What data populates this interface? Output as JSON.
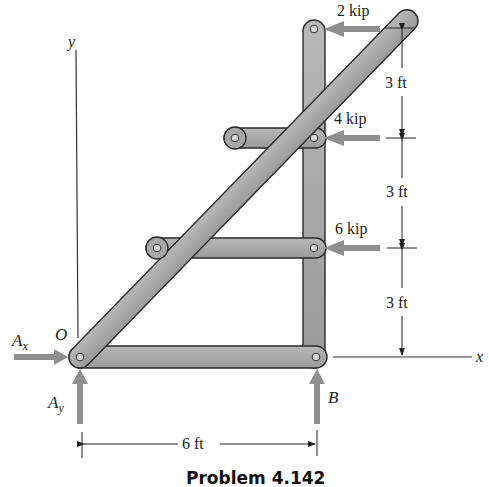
{
  "figure": {
    "caption": "Problem 4.142",
    "axes": {
      "x_label": "x",
      "y_label": "y",
      "origin_label": "O"
    },
    "loads": [
      {
        "label": "2 kip",
        "magnitude": 2,
        "unit": "kip",
        "direction": "left"
      },
      {
        "label": "4 kip",
        "magnitude": 4,
        "unit": "kip",
        "direction": "left"
      },
      {
        "label": "6 kip",
        "magnitude": 6,
        "unit": "kip",
        "direction": "left"
      }
    ],
    "reactions": {
      "ax": {
        "label_main": "A",
        "label_sub": "x",
        "direction": "right"
      },
      "ay": {
        "label_main": "A",
        "label_sub": "y",
        "direction": "up"
      },
      "b": {
        "label": "B",
        "direction": "up"
      }
    },
    "dimensions": {
      "vertical": [
        "3 ft",
        "3 ft",
        "3 ft"
      ],
      "horizontal": "6 ft"
    },
    "colors": {
      "member_fill": "#a9a9a9",
      "member_stroke": "#2a2a2a",
      "arrow": "#8e8e8e",
      "line": "#222222"
    }
  }
}
